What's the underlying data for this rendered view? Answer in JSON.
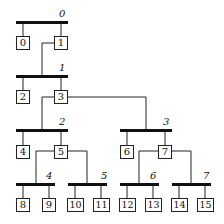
{
  "diagram": {
    "type": "tree",
    "bars": [
      {
        "label": "0",
        "children": [
          "0",
          "1"
        ]
      },
      {
        "label": "1",
        "children": [
          "2",
          "3"
        ]
      },
      {
        "label": "2",
        "children": [
          "4",
          "5"
        ]
      },
      {
        "label": "3",
        "children": [
          "6",
          "7"
        ]
      },
      {
        "label": "4",
        "children": [
          "8",
          "9"
        ]
      },
      {
        "label": "5",
        "children": [
          "10",
          "11"
        ]
      },
      {
        "label": "6",
        "children": [
          "12",
          "13"
        ]
      },
      {
        "label": "7",
        "children": [
          "14",
          "15"
        ]
      }
    ],
    "edges": [
      {
        "from_box": "1",
        "to_bar": "1"
      },
      {
        "from_box": "3",
        "to_bar": "2"
      },
      {
        "from_box": "3",
        "to_bar": "3"
      },
      {
        "from_box": "5",
        "to_bar": "4"
      },
      {
        "from_box": "5",
        "to_bar": "5"
      },
      {
        "from_box": "7",
        "to_bar": "6"
      },
      {
        "from_box": "7",
        "to_bar": "7"
      }
    ],
    "boxes": [
      "0",
      "1",
      "2",
      "3",
      "4",
      "5",
      "6",
      "7",
      "8",
      "9",
      "10",
      "11",
      "12",
      "13",
      "14",
      "15"
    ]
  }
}
